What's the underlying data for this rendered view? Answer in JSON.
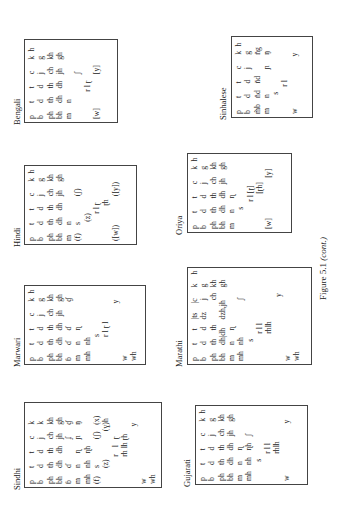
{
  "figure": {
    "caption_label": "Figure 5.1",
    "caption_suffix": "(cont.)"
  },
  "panels": [
    {
      "name": "Sindhi",
      "rows": [
        [
          [
            0,
            "p"
          ],
          [
            10,
            "t"
          ],
          [
            19,
            "t"
          ],
          [
            28,
            "c"
          ],
          [
            37,
            "k"
          ]
        ],
        [
          [
            0,
            "b"
          ],
          [
            10,
            "d"
          ],
          [
            19,
            "d"
          ],
          [
            28,
            "j"
          ],
          [
            37,
            "k"
          ]
        ],
        [
          [
            0,
            "ph"
          ],
          [
            10,
            "th"
          ],
          [
            19,
            "th"
          ],
          [
            28,
            "ch"
          ],
          [
            37,
            "kh"
          ]
        ],
        [
          [
            0,
            "bh"
          ],
          [
            10,
            "dh"
          ],
          [
            19,
            "dh"
          ],
          [
            28,
            "jh"
          ],
          [
            37,
            "gh"
          ]
        ],
        [
          [
            0,
            "ɓ"
          ],
          [
            10,
            "ɗ"
          ],
          [
            28,
            "ʄ"
          ],
          [
            37,
            "ɠ"
          ]
        ],
        [
          [
            0,
            "m"
          ],
          [
            10,
            "n"
          ],
          [
            19,
            "ɳ"
          ],
          [
            28,
            "ɲ"
          ],
          [
            37,
            "ŋ"
          ]
        ],
        [
          [
            0,
            "mh"
          ],
          [
            10,
            "nh"
          ],
          [
            19,
            "ɳh"
          ]
        ],
        [
          [
            0,
            "(f)"
          ],
          [
            10,
            "s"
          ],
          [
            28,
            "(ʃ)"
          ],
          [
            37,
            "(x)"
          ]
        ],
        [
          [
            10,
            "(z)"
          ],
          [
            33,
            "(ɣ)h"
          ]
        ],
        [
          [
            17,
            "r"
          ],
          [
            23,
            "l"
          ],
          [
            28,
            "ɽ"
          ]
        ],
        [
          [
            17,
            "rh lh ɽh"
          ]
        ],
        [
          [
            36,
            "y"
          ]
        ],
        [
          [
            0,
            "w"
          ]
        ],
        [
          [
            0,
            "wh"
          ]
        ]
      ]
    },
    {
      "name": "Marwari",
      "rows": [
        [
          [
            0,
            "p"
          ],
          [
            10,
            "t"
          ],
          [
            19,
            "t"
          ],
          [
            28,
            "c"
          ],
          [
            37,
            "k"
          ]
        ],
        [
          [
            0,
            "b"
          ],
          [
            10,
            "d"
          ],
          [
            19,
            "d"
          ],
          [
            28,
            "j"
          ],
          [
            37,
            "g"
          ]
        ],
        [
          [
            0,
            "ph"
          ],
          [
            10,
            "th"
          ],
          [
            19,
            "th"
          ],
          [
            28,
            "ch"
          ],
          [
            37,
            "kh"
          ]
        ],
        [
          [
            0,
            "bh"
          ],
          [
            10,
            "dh"
          ],
          [
            19,
            "dh"
          ],
          [
            28,
            "jh"
          ],
          [
            37,
            "gh"
          ]
        ],
        [
          [
            0,
            "ɓ"
          ],
          [
            10,
            "ɗ"
          ],
          [
            19,
            "ɗ"
          ],
          [
            37,
            "ɠ"
          ]
        ],
        [
          [
            0,
            "m"
          ],
          [
            10,
            "n"
          ],
          [
            19,
            "ɳ"
          ]
        ],
        [
          [
            0,
            "mh"
          ],
          [
            10,
            "nh"
          ]
        ],
        [
          [
            15,
            "s"
          ]
        ],
        [
          [
            15,
            "r l ɽ l"
          ]
        ],
        [
          [
            36,
            "y"
          ]
        ],
        [
          [
            0,
            "w"
          ]
        ],
        [
          [
            0,
            "wh"
          ]
        ]
      ],
      "extra": [
        [
          44,
          80,
          "h"
        ]
      ]
    },
    {
      "name": "Hindi",
      "rows": [
        [
          [
            0,
            "p"
          ],
          [
            10,
            "t"
          ],
          [
            19,
            "t"
          ],
          [
            28,
            "c"
          ],
          [
            37,
            "k"
          ]
        ],
        [
          [
            0,
            "b"
          ],
          [
            10,
            "d"
          ],
          [
            19,
            "d"
          ],
          [
            28,
            "j"
          ],
          [
            37,
            "g"
          ]
        ],
        [
          [
            0,
            "ph"
          ],
          [
            10,
            "th"
          ],
          [
            19,
            "th"
          ],
          [
            28,
            "ch"
          ],
          [
            37,
            "kh"
          ]
        ],
        [
          [
            0,
            "bh"
          ],
          [
            10,
            "dh"
          ],
          [
            19,
            "dh"
          ],
          [
            28,
            "jh"
          ],
          [
            37,
            "gh"
          ]
        ],
        [
          [
            0,
            "m"
          ],
          [
            10,
            "n"
          ]
        ],
        [
          [
            0,
            "(f)"
          ],
          [
            10,
            "s"
          ],
          [
            28,
            "(ʃ)"
          ]
        ],
        [
          [
            12,
            "(z)"
          ]
        ],
        [
          [
            17,
            "r l ɽ"
          ]
        ],
        [
          [
            22,
            "ɽh"
          ]
        ],
        [
          [
            0,
            "([w])"
          ],
          [
            28,
            "([y])"
          ]
        ]
      ],
      "extra": [
        [
          44,
          68,
          "h"
        ]
      ]
    },
    {
      "name": "Bengali",
      "rows": [
        [
          [
            0,
            "p"
          ],
          [
            10,
            "t"
          ],
          [
            19,
            "t"
          ],
          [
            28,
            "c"
          ],
          [
            37,
            "k"
          ]
        ],
        [
          [
            0,
            "b"
          ],
          [
            10,
            "d"
          ],
          [
            19,
            "d"
          ],
          [
            28,
            "j"
          ],
          [
            37,
            "g"
          ]
        ],
        [
          [
            0,
            "ph"
          ],
          [
            10,
            "th"
          ],
          [
            19,
            "th"
          ],
          [
            28,
            "ch"
          ],
          [
            37,
            "kh"
          ]
        ],
        [
          [
            0,
            "bh"
          ],
          [
            10,
            "dh"
          ],
          [
            19,
            "dh"
          ],
          [
            28,
            "jh"
          ],
          [
            37,
            "gh"
          ]
        ],
        [
          [
            0,
            "m"
          ],
          [
            10,
            "n"
          ]
        ],
        [
          [
            28,
            "ʃ"
          ]
        ],
        [
          [
            17,
            "r l ɽ"
          ]
        ],
        [
          [
            0,
            "[w]"
          ],
          [
            28,
            "[y]"
          ]
        ]
      ],
      "extra": [
        [
          44,
          45,
          "h"
        ]
      ]
    },
    {
      "name": "Gujarati",
      "rows": [
        [
          [
            0,
            "p"
          ],
          [
            10,
            "t"
          ],
          [
            19,
            "t"
          ],
          [
            28,
            "c"
          ],
          [
            37,
            "k"
          ]
        ],
        [
          [
            0,
            "b"
          ],
          [
            10,
            "d"
          ],
          [
            19,
            "d"
          ],
          [
            28,
            "j"
          ],
          [
            37,
            "g"
          ]
        ],
        [
          [
            0,
            "ph"
          ],
          [
            10,
            "th"
          ],
          [
            19,
            "th"
          ],
          [
            28,
            "ch"
          ],
          [
            37,
            "kh"
          ]
        ],
        [
          [
            0,
            "bh"
          ],
          [
            10,
            "dh"
          ],
          [
            19,
            "dh"
          ],
          [
            28,
            "jh"
          ],
          [
            37,
            "gh"
          ]
        ],
        [
          [
            0,
            "m"
          ],
          [
            10,
            "n"
          ],
          [
            19,
            "ɳ"
          ]
        ],
        [
          [
            0,
            "mh"
          ],
          [
            10,
            "nh"
          ],
          [
            19,
            "ɳh"
          ],
          [
            28,
            "ʃ"
          ]
        ],
        [
          [
            12,
            "s"
          ]
        ],
        [
          [
            17,
            "r l l"
          ]
        ],
        [
          [
            17,
            "rhlh"
          ]
        ],
        [
          [
            0,
            "w"
          ],
          [
            36,
            "y"
          ]
        ]
      ],
      "extra": [
        [
          44,
          45,
          "h"
        ]
      ]
    },
    {
      "name": "Marathi",
      "rows": [
        [
          [
            0,
            "p"
          ],
          [
            10,
            "t"
          ],
          [
            19,
            "t"
          ],
          [
            26,
            "|ts"
          ],
          [
            36,
            "|c"
          ],
          [
            46,
            "k"
          ]
        ],
        [
          [
            0,
            "b"
          ],
          [
            10,
            "d"
          ],
          [
            19,
            "d"
          ],
          [
            26,
            "dz"
          ],
          [
            38,
            "j"
          ],
          [
            46,
            "g"
          ]
        ],
        [
          [
            0,
            "ph"
          ],
          [
            10,
            "th"
          ],
          [
            19,
            "th"
          ],
          [
            38,
            "ch"
          ],
          [
            46,
            "kh"
          ]
        ],
        [
          [
            0,
            "bh"
          ],
          [
            10,
            "dh|dh"
          ],
          [
            26,
            "dzh,jh"
          ],
          [
            46,
            "gh"
          ]
        ],
        [
          [
            0,
            "m"
          ],
          [
            10,
            "n"
          ],
          [
            19,
            "ɳ"
          ]
        ],
        [
          [
            0,
            "mh"
          ],
          [
            10,
            "nh"
          ],
          [
            38,
            "ʃ"
          ]
        ],
        [
          [
            12,
            "s"
          ]
        ],
        [
          [
            17,
            "r l l"
          ]
        ],
        [
          [
            17,
            "rhlh"
          ]
        ],
        [
          [
            40,
            "y"
          ]
        ],
        [
          [
            0,
            "w"
          ]
        ],
        [
          [
            0,
            "wh"
          ]
        ]
      ],
      "extra": [
        [
          56,
          45,
          "h"
        ]
      ]
    },
    {
      "name": "Oriya",
      "rows": [
        [
          [
            0,
            "p"
          ],
          [
            10,
            "t"
          ],
          [
            19,
            "t"
          ],
          [
            28,
            "c"
          ],
          [
            37,
            "k"
          ]
        ],
        [
          [
            0,
            "b"
          ],
          [
            10,
            "d"
          ],
          [
            19,
            "d"
          ],
          [
            28,
            "j"
          ],
          [
            37,
            "g"
          ]
        ],
        [
          [
            0,
            "ph"
          ],
          [
            10,
            "th"
          ],
          [
            19,
            "th"
          ],
          [
            28,
            "ch"
          ],
          [
            37,
            "kh"
          ]
        ],
        [
          [
            0,
            "bh"
          ],
          [
            10,
            "dh"
          ],
          [
            19,
            "dh"
          ],
          [
            28,
            "jh"
          ],
          [
            37,
            "gh"
          ]
        ],
        [
          [
            0,
            "m"
          ],
          [
            10,
            "n"
          ],
          [
            19,
            "ɳ"
          ]
        ],
        [
          [
            12,
            "s"
          ]
        ],
        [
          [
            17,
            "r l [ɽ]"
          ]
        ],
        [
          [
            22,
            "[ɽh]"
          ]
        ],
        [
          [
            0,
            "[w]"
          ],
          [
            32,
            "[y]"
          ]
        ]
      ],
      "extra": [
        [
          44,
          45,
          "h"
        ]
      ]
    },
    {
      "name": "Sinhalese",
      "rows": [
        [
          [
            0,
            "p"
          ],
          [
            10,
            "t"
          ],
          [
            19,
            "t"
          ],
          [
            28,
            "c"
          ],
          [
            37,
            "k"
          ]
        ],
        [
          [
            0,
            "b"
          ],
          [
            10,
            "d"
          ],
          [
            19,
            "d"
          ],
          [
            28,
            "j"
          ],
          [
            37,
            "g"
          ]
        ],
        [
          [
            0,
            "m̃b"
          ],
          [
            10,
            "n̆d"
          ],
          [
            19,
            "n̆d"
          ],
          [
            37,
            "n̆g"
          ]
        ],
        [
          [
            0,
            "m"
          ],
          [
            10,
            "n"
          ],
          [
            28,
            "ɲ"
          ],
          [
            37,
            "ŋ"
          ]
        ],
        [
          [
            12,
            "s"
          ]
        ],
        [
          [
            17,
            "r l"
          ]
        ],
        [
          [
            0,
            "w"
          ],
          [
            36,
            "y"
          ]
        ]
      ],
      "extra": [
        [
          44,
          45,
          "h"
        ]
      ]
    }
  ]
}
